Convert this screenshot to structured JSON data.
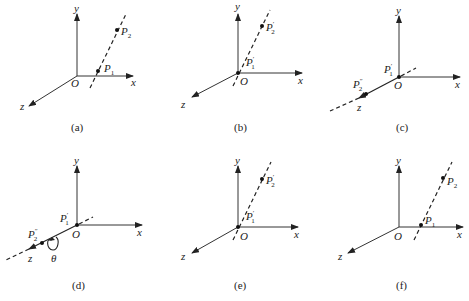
{
  "figure": {
    "axis_labels": {
      "x": "x",
      "y": "y",
      "z": "z",
      "origin": "O"
    },
    "angle_label": "θ",
    "panels": [
      {
        "id": "a",
        "caption": "(a)",
        "points": [
          {
            "name": "P",
            "sub": "1",
            "prime": ""
          },
          {
            "name": "P",
            "sub": "2",
            "prime": ""
          }
        ]
      },
      {
        "id": "b",
        "caption": "(b)",
        "points": [
          {
            "name": "P",
            "sub": "1",
            "prime": "′"
          },
          {
            "name": "P",
            "sub": "2",
            "prime": "′"
          }
        ]
      },
      {
        "id": "c",
        "caption": "(c)",
        "points": [
          {
            "name": "P",
            "sub": "1",
            "prime": "′"
          },
          {
            "name": "P",
            "sub": "2",
            "prime": "″"
          }
        ]
      },
      {
        "id": "d",
        "caption": "(d)",
        "points": [
          {
            "name": "P",
            "sub": "1",
            "prime": "′"
          },
          {
            "name": "P",
            "sub": "2",
            "prime": "″"
          }
        ]
      },
      {
        "id": "e",
        "caption": "(e)",
        "points": [
          {
            "name": "P",
            "sub": "1",
            "prime": "′"
          },
          {
            "name": "P",
            "sub": "2",
            "prime": "′"
          }
        ]
      },
      {
        "id": "f",
        "caption": "(f)",
        "points": [
          {
            "name": "P",
            "sub": "1",
            "prime": ""
          },
          {
            "name": "P",
            "sub": "2",
            "prime": ""
          }
        ]
      }
    ]
  }
}
